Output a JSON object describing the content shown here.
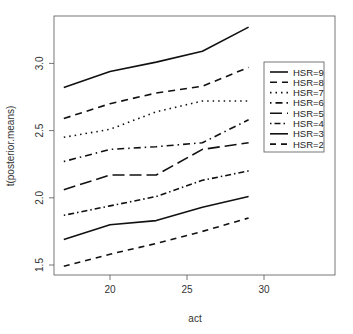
{
  "chart_data": {
    "type": "line",
    "title": "",
    "xlabel": "act",
    "ylabel": "t(posterior.means)",
    "x": [
      17,
      20,
      23,
      26,
      29
    ],
    "xticks": [
      20,
      25,
      30
    ],
    "yticks": [
      1.5,
      2.0,
      2.5,
      3.0
    ],
    "xlim": [
      15.5,
      34.5
    ],
    "ylim": [
      1.43,
      3.34
    ],
    "grid": false,
    "legend_position": "right-inside",
    "series": [
      {
        "name": "HSR=9",
        "dash": "",
        "width": 1.6,
        "values": [
          2.82,
          2.94,
          3.01,
          3.09,
          3.27
        ]
      },
      {
        "name": "HSR=8",
        "dash": "7,5",
        "width": 1.6,
        "values": [
          2.59,
          2.7,
          2.78,
          2.83,
          2.97
        ]
      },
      {
        "name": "HSR=7",
        "dash": "1.5,4",
        "width": 1.6,
        "values": [
          2.45,
          2.51,
          2.64,
          2.72,
          2.72
        ]
      },
      {
        "name": "HSR=6",
        "dash": "1.5,4,7,4",
        "width": 1.6,
        "values": [
          2.27,
          2.36,
          2.38,
          2.41,
          2.58
        ]
      },
      {
        "name": "HSR=5",
        "dash": "12,5",
        "width": 1.6,
        "values": [
          2.06,
          2.17,
          2.17,
          2.36,
          2.41
        ]
      },
      {
        "name": "HSR=4",
        "dash": "1.5,3,6,3",
        "width": 1.6,
        "values": [
          1.87,
          1.94,
          2.01,
          2.13,
          2.2
        ]
      },
      {
        "name": "HSR=3",
        "dash": "",
        "width": 1.6,
        "values": [
          1.69,
          1.8,
          1.83,
          1.93,
          2.01
        ]
      },
      {
        "name": "HSR=2",
        "dash": "6,5",
        "width": 1.6,
        "values": [
          1.49,
          1.58,
          1.66,
          1.75,
          1.85
        ]
      }
    ]
  }
}
